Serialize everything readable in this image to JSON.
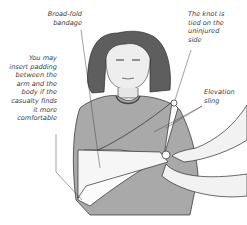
{
  "illustration": {
    "subject": "child with arm in elevation sling",
    "colors": {
      "line": "#2b2b2b",
      "skin": "#efefef",
      "shirt": "#a9a9a9",
      "sling": "#fbfbfb",
      "hair": "#5a5a5a",
      "background": "#ffffff"
    }
  },
  "labels": {
    "bandage": [
      "Broad-fold",
      "bandage"
    ],
    "knot": [
      "The knot is",
      "tied on the",
      "uninjured",
      "side"
    ],
    "padding": [
      "You may",
      "insert padding",
      "between the",
      "arm and the",
      "body if the",
      "casualty finds",
      "it more",
      "comfortable"
    ],
    "sling": [
      "Elevation",
      "sling"
    ]
  }
}
